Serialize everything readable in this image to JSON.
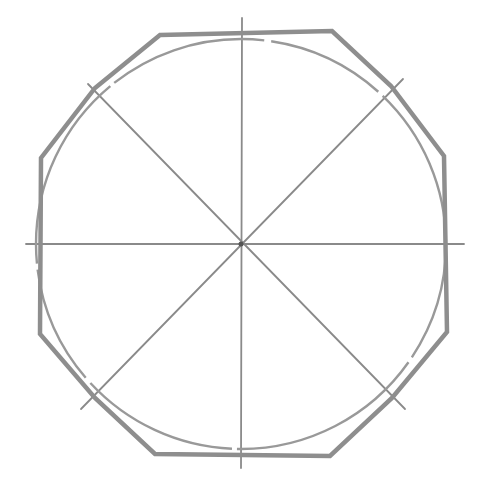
{
  "diagram": {
    "title": "",
    "colors": {
      "background": "#ffffff",
      "octagon_stroke": "#8e8e8e",
      "circle_stroke": "#999999",
      "guide_stroke": "#8a8a8a"
    },
    "center": {
      "x": 241,
      "y": 244
    },
    "circle": {
      "cx": 241,
      "cy": 244,
      "r": 205
    },
    "octagon_points": [
      [
        160,
        35
      ],
      [
        332,
        31
      ],
      [
        391,
        86
      ],
      [
        444,
        156
      ],
      [
        447,
        332
      ],
      [
        392,
        398
      ],
      [
        330,
        456
      ],
      [
        155,
        454
      ],
      [
        95,
        398
      ],
      [
        40,
        334
      ],
      [
        41,
        158
      ],
      [
        95,
        88
      ]
    ],
    "guide_lines": [
      {
        "name": "vertical-axis",
        "x1": 242,
        "y1": 18,
        "x2": 241,
        "y2": 468
      },
      {
        "name": "horizontal-axis",
        "x1": 26,
        "y1": 244,
        "x2": 464,
        "y2": 244
      },
      {
        "name": "diagonal-nw-se",
        "x1": 88,
        "y1": 84,
        "x2": 405,
        "y2": 409
      },
      {
        "name": "diagonal-ne-sw",
        "x1": 403,
        "y1": 79,
        "x2": 81,
        "y2": 409
      }
    ]
  }
}
